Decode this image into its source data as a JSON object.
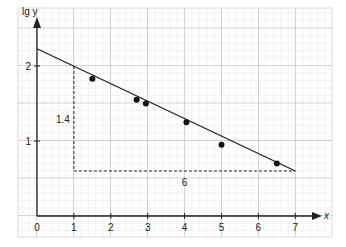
{
  "chart_data": {
    "type": "scatter",
    "title": "",
    "xlabel": "x",
    "ylabel": "lg y",
    "xlim": [
      0,
      7.4
    ],
    "ylim": [
      0,
      2.5
    ],
    "x_ticks": [
      "0",
      "1",
      "2",
      "3",
      "4",
      "5",
      "6",
      "7"
    ],
    "y_ticks": [
      "1",
      "2"
    ],
    "grid": true,
    "points": [
      {
        "x": 1.5,
        "y": 1.83
      },
      {
        "x": 2.7,
        "y": 1.55
      },
      {
        "x": 2.95,
        "y": 1.5
      },
      {
        "x": 4.05,
        "y": 1.25
      },
      {
        "x": 5.0,
        "y": 0.95
      },
      {
        "x": 6.5,
        "y": 0.7
      }
    ],
    "fit_line": {
      "x0": 0,
      "y0": 2.23,
      "x1": 7,
      "y1": 0.6
    },
    "slope_triangle": {
      "x_start": 1,
      "x_end": 7,
      "y_base": 0.6,
      "y_top": 2.0,
      "dx_label": "6",
      "dy_label": "1.4"
    }
  }
}
